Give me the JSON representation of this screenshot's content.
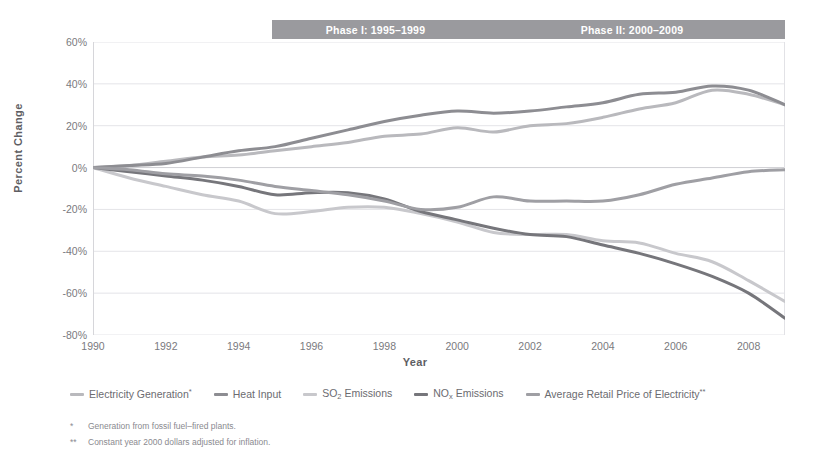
{
  "banners": [
    {
      "name": "phase-1",
      "label": "Phase I: 1995–1999"
    },
    {
      "name": "phase-2",
      "label": "Phase II: 2000–2009"
    }
  ],
  "axis": {
    "ylabel": "Percent Change",
    "xlabel": "Year"
  },
  "legend": [
    {
      "key": "electricity_generation",
      "label": "Electricity Generation",
      "sup": "*",
      "color": "#b9b9bd"
    },
    {
      "key": "heat_input",
      "label": "Heat Input",
      "sup": "",
      "color": "#8d8d92"
    },
    {
      "key": "so2_emissions",
      "label": "SO",
      "sub": "2",
      "label2": " Emissions",
      "sup": "",
      "color": "#c8c8cc"
    },
    {
      "key": "nox_emissions",
      "label": "NO",
      "sub": "x",
      "label2": " Emissions",
      "sup": "",
      "color": "#76767b"
    },
    {
      "key": "retail_price",
      "label": "Average Retail Price of Electricity",
      "sup": "**",
      "color": "#9f9fa4"
    }
  ],
  "footnotes": [
    {
      "mark": "*",
      "text": "Generation from fossil fuel–fired plants."
    },
    {
      "mark": "**",
      "text": "Constant year 2000 dollars adjusted for inflation."
    }
  ],
  "chart_data": {
    "type": "line",
    "title": "",
    "xlabel": "Year",
    "ylabel": "Percent Change",
    "xlim": [
      1990,
      2009
    ],
    "ylim": [
      -80,
      60
    ],
    "ytick_labels": [
      "60%",
      "40%",
      "20%",
      "0%",
      "-20%",
      "-40%",
      "-60%",
      "-80%"
    ],
    "ytick_values": [
      60,
      40,
      20,
      0,
      -20,
      -40,
      -60,
      -80
    ],
    "xtick_labels": [
      "1990",
      "1992",
      "1994",
      "1996",
      "1998",
      "2000",
      "2002",
      "2004",
      "2006",
      "2008"
    ],
    "xtick_values": [
      1990,
      1992,
      1994,
      1996,
      1998,
      2000,
      2002,
      2004,
      2006,
      2008
    ],
    "grid": "horizontal",
    "legend_position": "below",
    "x": [
      1990,
      1991,
      1992,
      1993,
      1994,
      1995,
      1996,
      1997,
      1998,
      1999,
      2000,
      2001,
      2002,
      2003,
      2004,
      2005,
      2006,
      2007,
      2008,
      2009
    ],
    "annotations": [
      {
        "text": "Phase I: 1995–1999",
        "x_range": [
          1995,
          1999
        ]
      },
      {
        "text": "Phase II: 2000–2009",
        "x_range": [
          2000,
          2009
        ]
      }
    ],
    "series": [
      {
        "name": "Electricity Generation*",
        "color": "#b9b9bd",
        "values": [
          0,
          1,
          3,
          5,
          6,
          8,
          10,
          12,
          15,
          16,
          19,
          17,
          20,
          21,
          24,
          28,
          31,
          37,
          35,
          30
        ]
      },
      {
        "name": "Heat Input",
        "color": "#8d8d92",
        "values": [
          0,
          1,
          2,
          5,
          8,
          10,
          14,
          18,
          22,
          25,
          27,
          26,
          27,
          29,
          31,
          35,
          36,
          39,
          37,
          30
        ]
      },
      {
        "name": "SO2 Emissions",
        "color": "#c8c8cc",
        "values": [
          0,
          -5,
          -9,
          -13,
          -16,
          -22,
          -21,
          -19,
          -19,
          -22,
          -26,
          -31,
          -32,
          -32,
          -35,
          -36,
          -41,
          -45,
          -54,
          -64
        ]
      },
      {
        "name": "NOx Emissions",
        "color": "#76767b",
        "values": [
          0,
          -2,
          -4,
          -6,
          -9,
          -13,
          -12,
          -12,
          -15,
          -21,
          -25,
          -29,
          -32,
          -33,
          -37,
          -41,
          -46,
          -52,
          -60,
          -72
        ]
      },
      {
        "name": "Average Retail Price of Electricity**",
        "color": "#9f9fa4",
        "values": [
          0,
          -1,
          -3,
          -4,
          -6,
          -9,
          -11,
          -13,
          -16,
          -20,
          -19,
          -14,
          -16,
          -16,
          -16,
          -13,
          -8,
          -5,
          -2,
          -1
        ]
      }
    ]
  }
}
